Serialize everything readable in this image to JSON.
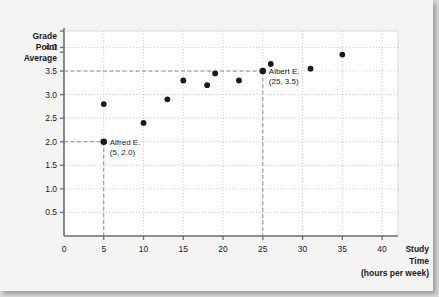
{
  "figure": {
    "background_color": "#f4f4f2",
    "point_color": "#1a1a1a",
    "grid_color": "#b9b9b9",
    "axis_color": "#6d6d6d",
    "guide_color": "#8a8a8a"
  },
  "chart_data": {
    "type": "scatter",
    "title": "",
    "xlabel_lines": [
      "Study",
      "Time",
      "(hours per week)"
    ],
    "ylabel_lines": [
      "Grade",
      "Point",
      "Average"
    ],
    "xlim": [
      0,
      42
    ],
    "ylim": [
      0,
      4.35
    ],
    "xticks": [
      0,
      5,
      10,
      15,
      20,
      25,
      30,
      35,
      40
    ],
    "xticklabels": [
      "0",
      "5",
      "10",
      "15",
      "20",
      "25",
      "30",
      "35",
      "40"
    ],
    "yticks": [
      0.5,
      1.0,
      1.5,
      2.0,
      2.5,
      3.0,
      3.5,
      4.0
    ],
    "yticklabels": [
      "0.5",
      "1.0",
      "1.5",
      "2.0",
      "2.5",
      "3.0",
      "3.5",
      "4.0"
    ],
    "grid": true,
    "legend": "none",
    "points": [
      {
        "x": 5,
        "y": 2.0,
        "highlight": true
      },
      {
        "x": 5,
        "y": 2.8,
        "highlight": false
      },
      {
        "x": 10,
        "y": 2.4,
        "highlight": false
      },
      {
        "x": 13,
        "y": 2.9,
        "highlight": false
      },
      {
        "x": 15,
        "y": 3.3,
        "highlight": false
      },
      {
        "x": 18,
        "y": 3.2,
        "highlight": false
      },
      {
        "x": 19,
        "y": 3.45,
        "highlight": false
      },
      {
        "x": 22,
        "y": 3.3,
        "highlight": false
      },
      {
        "x": 25,
        "y": 3.5,
        "highlight": true
      },
      {
        "x": 26,
        "y": 3.65,
        "highlight": false
      },
      {
        "x": 31,
        "y": 3.55,
        "highlight": false
      },
      {
        "x": 35,
        "y": 3.85,
        "highlight": false
      }
    ],
    "annotations": [
      {
        "name": "alfred",
        "line1": "Alfred E.",
        "line2": "(5, 2.0)",
        "x": 5,
        "y": 2.0,
        "guide_x": true,
        "guide_y": true
      },
      {
        "name": "albert",
        "line1": "Albert E.",
        "line2": "(25, 3.5)",
        "x": 25,
        "y": 3.5,
        "guide_x": true,
        "guide_y": true
      }
    ]
  }
}
